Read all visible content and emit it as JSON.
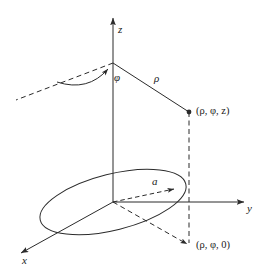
{
  "figure": {
    "type": "diagram",
    "background_color": "#ffffff",
    "stroke_color": "#2b2b2b"
  },
  "axes": {
    "z_label": "z",
    "y_label": "y",
    "x_label": "x"
  },
  "labels": {
    "phi": "φ",
    "rho": "ρ",
    "radius": "a",
    "point_3d": "(ρ, φ, z)",
    "point_projection": "(ρ, φ, 0)"
  },
  "geometry": {
    "origin": {
      "x": 113,
      "y": 202
    },
    "z_axis_top": {
      "x": 113,
      "y": 14
    },
    "z_vertex": {
      "x": 113,
      "y": 63
    },
    "y_axis_end": {
      "x": 248,
      "y": 202
    },
    "x_axis_end": {
      "x": 16,
      "y": 257
    },
    "point_3d": {
      "x": 189,
      "y": 112
    },
    "point_projection": {
      "x": 189,
      "y": 246
    },
    "ellipse_center": {
      "x": 113,
      "y": 202
    },
    "ellipse_rx": 75,
    "ellipse_ry": 28,
    "ellipse_rotation_deg": -14,
    "radius_arrow_tip": {
      "x": 178,
      "y": 187
    },
    "phi_arc_start": {
      "x": 65,
      "y": 78
    },
    "phi_arc_end": {
      "x": 112,
      "y": 67
    },
    "dashed_upper_left_end": {
      "x": 16,
      "y": 100
    }
  },
  "style": {
    "solid_line_width": 1,
    "dashed_pattern": "5 3.5"
  }
}
